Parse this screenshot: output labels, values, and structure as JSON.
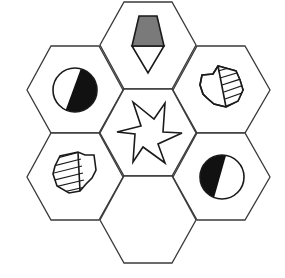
{
  "puzzle": {
    "type": "hexagon-pattern-puzzle",
    "stroke_color": "#1a1a1a",
    "grey_fill": "#7a7a7a",
    "dark_fill": "#111111",
    "cells": [
      {
        "position": "top",
        "content": "grey-trapezoid-over-white-diamond"
      },
      {
        "position": "upper-left",
        "content": "circle-half-black-right"
      },
      {
        "position": "upper-right",
        "content": "octagon-hatched-right"
      },
      {
        "position": "center",
        "content": "six-point-star"
      },
      {
        "position": "lower-left",
        "content": "octagon-hatched-left"
      },
      {
        "position": "lower-right",
        "content": "circle-half-black-left"
      },
      {
        "position": "bottom",
        "content": "empty"
      }
    ]
  }
}
